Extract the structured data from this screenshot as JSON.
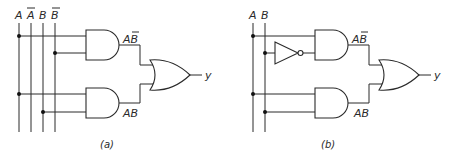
{
  "diagram": {
    "type": "logic-circuit",
    "colors": {
      "ink": "#2a2a2a",
      "background": "#ffffff"
    },
    "a": {
      "caption": "(a)",
      "inputs": [
        "A",
        "A̅",
        "B",
        "B̅"
      ],
      "input_labels": {
        "A": "A",
        "A_bar": "A",
        "B": "B",
        "B_bar": "B"
      },
      "gates": [
        {
          "id": "and1",
          "kind": "AND",
          "inputs": [
            "A",
            "B̅"
          ],
          "output_label": "AB̅"
        },
        {
          "id": "and2",
          "kind": "AND",
          "inputs": [
            "A",
            "B"
          ],
          "output_label": "AB"
        },
        {
          "id": "or1",
          "kind": "OR",
          "inputs": [
            "and1",
            "and2"
          ],
          "output_label": "y"
        }
      ],
      "labels": {
        "and1_out_a": "A",
        "and1_out_b": "B",
        "and2_out": "AB",
        "output": "y"
      }
    },
    "b": {
      "caption": "(b)",
      "inputs": [
        "A",
        "B"
      ],
      "input_labels": {
        "A": "A",
        "B": "B"
      },
      "gates": [
        {
          "id": "not1",
          "kind": "NOT",
          "inputs": [
            "B"
          ]
        },
        {
          "id": "and1",
          "kind": "AND",
          "inputs": [
            "A",
            "not1"
          ],
          "output_label": "AB̅"
        },
        {
          "id": "and2",
          "kind": "AND",
          "inputs": [
            "A",
            "B"
          ],
          "output_label": "AB"
        },
        {
          "id": "or1",
          "kind": "OR",
          "inputs": [
            "and1",
            "and2"
          ],
          "output_label": "y"
        }
      ],
      "labels": {
        "and1_out_a": "A",
        "and1_out_b": "B",
        "and2_out": "AB",
        "output": "y"
      }
    }
  }
}
